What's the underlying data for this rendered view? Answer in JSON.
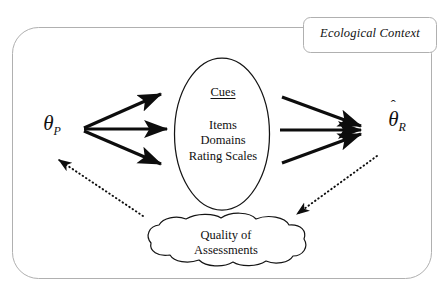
{
  "diagram": {
    "title_box": {
      "label": "Ecological Context"
    },
    "left_node": {
      "symbol": "θ",
      "subscript": "P",
      "full": "θP"
    },
    "right_node": {
      "symbol": "θ",
      "hat": "ˆ",
      "subscript": "R",
      "full": "θ̂R"
    },
    "cues_node": {
      "heading": "Cues",
      "items": [
        "Items",
        "Domains",
        "Rating Scales"
      ]
    },
    "cloud_node": {
      "lines": [
        "Quality of",
        "Assessments"
      ]
    },
    "arrows": {
      "solid_left_count": 3,
      "solid_right_count": 3,
      "dotted_count": 2,
      "dotted_left_target": "θP",
      "dotted_right_target": "Quality of Assessments"
    },
    "colors": {
      "ink": "#000000",
      "frame": "#a8a8a8",
      "background": "#ffffff"
    }
  }
}
